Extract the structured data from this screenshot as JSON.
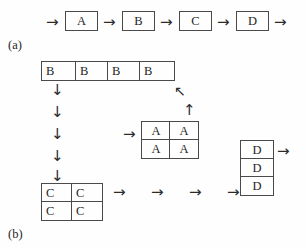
{
  "figure": {
    "panel_a": {
      "caption": "(a)",
      "sequence_boxes": [
        {
          "label": "A"
        },
        {
          "label": "B"
        },
        {
          "label": "C"
        },
        {
          "label": "D"
        }
      ],
      "arrows": [
        {
          "glyph": "→",
          "name": "arrow-right-into-a"
        },
        {
          "glyph": "→",
          "name": "arrow-right-a-to-b"
        },
        {
          "glyph": "→",
          "name": "arrow-right-b-to-c"
        },
        {
          "glyph": "→",
          "name": "arrow-right-c-to-d"
        },
        {
          "glyph": "→",
          "name": "arrow-right-out-of-d"
        }
      ]
    },
    "panel_b": {
      "caption": "(b)",
      "b_row": {
        "name": "b-row-block",
        "cells": [
          {
            "label": "B"
          },
          {
            "label": "B"
          },
          {
            "label": "B"
          },
          {
            "label": "B"
          }
        ]
      },
      "a_block": {
        "name": "a-2x2-block",
        "rows": [
          [
            {
              "label": "A"
            },
            {
              "label": "A"
            }
          ],
          [
            {
              "label": "A"
            },
            {
              "label": "A"
            }
          ]
        ]
      },
      "c_block": {
        "name": "c-2x2-block",
        "rows": [
          [
            {
              "label": "C"
            },
            {
              "label": "C"
            }
          ],
          [
            {
              "label": "C"
            },
            {
              "label": "C"
            }
          ]
        ]
      },
      "d_column": {
        "name": "d-column-block",
        "cells": [
          {
            "label": "D"
          },
          {
            "label": "D"
          },
          {
            "label": "D"
          }
        ]
      },
      "down_arrows": [
        {
          "glyph": "↓"
        },
        {
          "glyph": "↓"
        },
        {
          "glyph": "↓"
        },
        {
          "glyph": "↓"
        },
        {
          "glyph": "↓"
        }
      ],
      "bottom_arrows": [
        {
          "glyph": "→"
        },
        {
          "glyph": "→"
        },
        {
          "glyph": "→"
        },
        {
          "glyph": "→"
        }
      ],
      "diagonal_arrow": {
        "glyph": "↖",
        "name": "arrow-up-left-diagonal"
      },
      "up_arrow": {
        "glyph": "↑",
        "name": "arrow-up-into-a-block"
      },
      "a_entry_arrow": {
        "glyph": "→",
        "name": "arrow-right-into-a-block"
      },
      "d_exit_arrow": {
        "glyph": "→",
        "name": "arrow-right-out-of-d-column"
      }
    }
  },
  "colors": {
    "stroke": "#4a4a4a",
    "text": "#1f1f1f",
    "background": "#fefefe"
  }
}
